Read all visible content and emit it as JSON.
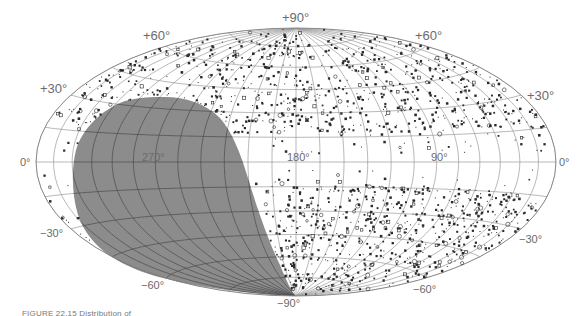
{
  "chart_data": {
    "type": "scatter",
    "projection": "hammer-aitoff (galactic coordinates)",
    "title": "",
    "caption": "FIGURE 22.15 Distribution of",
    "longitude_labels": [
      {
        "text": "270°",
        "lon": 270,
        "x": 142,
        "y": 152
      },
      {
        "text": "180°",
        "lon": 180,
        "x": 287,
        "y": 152
      },
      {
        "text": "90°",
        "lon": 90,
        "x": 431,
        "y": 152
      }
    ],
    "latitude_labels": [
      {
        "text": "+90°",
        "lat": 90,
        "side": "center",
        "x": 282,
        "y": 12,
        "big": true
      },
      {
        "text": "−90°",
        "lat": -90,
        "side": "center",
        "x": 277,
        "y": 298
      },
      {
        "text": "+60°",
        "lat": 60,
        "side": "left",
        "x": 143,
        "y": 30,
        "big": true
      },
      {
        "text": "+60°",
        "lat": 60,
        "side": "right",
        "x": 415,
        "y": 30,
        "big": true
      },
      {
        "text": "+30°",
        "lat": 30,
        "side": "left",
        "x": 40,
        "y": 83,
        "big": true
      },
      {
        "text": "+30°",
        "lat": 30,
        "side": "right",
        "x": 527,
        "y": 90,
        "big": true
      },
      {
        "text": "0°",
        "lat": 0,
        "side": "left",
        "x": 20,
        "y": 157
      },
      {
        "text": "0°",
        "lat": 0,
        "side": "right",
        "x": 559,
        "y": 157
      },
      {
        "text": "−30°",
        "lat": -30,
        "side": "left",
        "x": 40,
        "y": 228
      },
      {
        "text": "−30°",
        "lat": -30,
        "side": "right",
        "x": 519,
        "y": 234
      },
      {
        "text": "−60°",
        "lat": -60,
        "side": "left",
        "x": 141,
        "y": 280
      },
      {
        "text": "−60°",
        "lat": -60,
        "side": "right",
        "x": 413,
        "y": 284
      }
    ],
    "grid": {
      "on": true,
      "lon_step_deg": 15,
      "lat_step_deg": 15
    },
    "shaded_region": {
      "description": "unobserved region (zone not surveyed)",
      "approx_lon_range": [
        195,
        340
      ],
      "approx_lat_range": [
        -90,
        40
      ]
    },
    "series": [
      {
        "name": "filled dots (objects)",
        "marker": "filled-square",
        "approx_count": 900,
        "density_note": "dense in northern galactic hemisphere, sparse near equator, dense in south for lon 0-180"
      },
      {
        "name": "open markers (objects)",
        "marker": "open-circle/square",
        "approx_count": 120
      }
    ],
    "colors": {
      "grid": "#9a9a9a",
      "shade": "#8c8c8c",
      "shade_grid": "#4f4f4f",
      "points": "#2a2a2a",
      "labels": "#6b6b6b"
    }
  }
}
